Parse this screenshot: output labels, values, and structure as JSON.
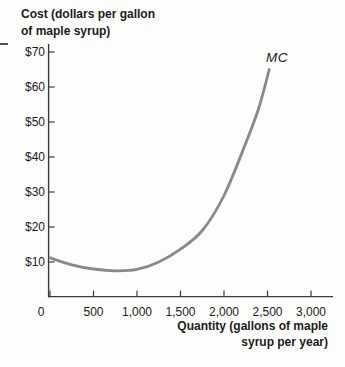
{
  "title": {
    "line1": "Cost (dollars per gallon",
    "line2": "of maple syrup)"
  },
  "curve_label": "MC",
  "y_axis": {
    "tick_labels": [
      "$10",
      "$20",
      "$30",
      "$40",
      "$50",
      "$60",
      "$70"
    ]
  },
  "x_axis": {
    "tick_labels": [
      "0",
      "500",
      "1,000",
      "1,500",
      "2,000",
      "2,500",
      "3,000"
    ],
    "label_line1": "Quantity (gallons of maple",
    "label_line2": "syrup per year)"
  },
  "colors": {
    "curve": "#898989",
    "axis": "#3a3a3a",
    "text": "#1b1b1b"
  },
  "chart_data": {
    "type": "line",
    "title": "Cost (dollars per gallon of maple syrup)",
    "xlabel": "Quantity (gallons of maple syrup per year)",
    "ylabel": "Cost (dollars per gallon of maple syrup)",
    "xlim": [
      0,
      3250
    ],
    "ylim": [
      0,
      75
    ],
    "x_ticks": [
      0,
      500,
      1000,
      1500,
      2000,
      2500,
      3000
    ],
    "y_ticks": [
      10,
      20,
      30,
      40,
      50,
      60,
      70
    ],
    "grid": false,
    "legend_position": "none",
    "series": [
      {
        "name": "MC",
        "label_position": "end-of-curve",
        "points": [
          [
            0,
            11.2
          ],
          [
            250,
            9.2
          ],
          [
            500,
            8.0
          ],
          [
            750,
            7.5
          ],
          [
            1000,
            7.9
          ],
          [
            1250,
            10.0
          ],
          [
            1500,
            13.7
          ],
          [
            1750,
            19.0
          ],
          [
            2000,
            29.0
          ],
          [
            2250,
            44.0
          ],
          [
            2400,
            54.0
          ],
          [
            2520,
            65.0
          ]
        ]
      }
    ]
  }
}
